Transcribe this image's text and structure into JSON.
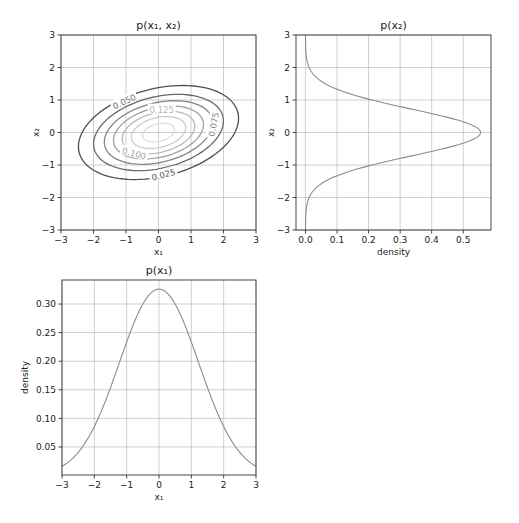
{
  "figure": {
    "width": 519,
    "height": 523,
    "background": "#ffffff"
  },
  "chart_data": [
    {
      "id": "joint",
      "type": "contour",
      "title": "p(x₁, x₂)",
      "xlabel": "x₁",
      "ylabel": "x₂",
      "xlim": [
        -3,
        3
      ],
      "ylim": [
        -3,
        3
      ],
      "xticks": [
        -3,
        -2,
        -1,
        0,
        1,
        2,
        3
      ],
      "yticks": [
        -3,
        -2,
        -1,
        0,
        1,
        2,
        3
      ],
      "xtick_labels": [
        "−3",
        "−2",
        "−1",
        "0",
        "1",
        "2",
        "3"
      ],
      "ytick_labels": [
        "−3",
        "−2",
        "−1",
        "0",
        "1",
        "2",
        "3"
      ],
      "grid": true,
      "distribution": {
        "mean": [
          0,
          0
        ],
        "sigma_x1": 1.224,
        "sigma_x2": 0.719,
        "rho": 0.3
      },
      "levels": [
        0.025,
        0.05,
        0.075,
        0.1,
        0.125,
        0.15,
        0.175
      ],
      "level_colors": [
        "#505050",
        "#6a6a6a",
        "#858585",
        "#a0a0a0",
        "#b8b8b8",
        "#cccccc",
        "#dddddd"
      ],
      "contour_labels": [
        {
          "text": "0.025",
          "x": 0.15,
          "y": -1.3,
          "angle": -15
        },
        {
          "text": "0.050",
          "x": -1.05,
          "y": 0.95,
          "angle": -25
        },
        {
          "text": "0.075",
          "x": 1.7,
          "y": 0.25,
          "angle": -80
        },
        {
          "text": "0.100",
          "x": -0.75,
          "y": -0.65,
          "angle": 15
        },
        {
          "text": "0.125",
          "x": 0.1,
          "y": 0.7,
          "angle": 0
        }
      ],
      "bbox": {
        "left": 61,
        "top": 35,
        "width": 195,
        "height": 195
      }
    },
    {
      "id": "marginal_x2",
      "type": "line",
      "orientation": "vertical",
      "title": "p(x₂)",
      "xlabel": "density",
      "ylabel": "x₂",
      "xlim": [
        -0.03,
        0.588
      ],
      "ylim": [
        -3,
        3
      ],
      "xticks": [
        0.0,
        0.1,
        0.2,
        0.3,
        0.4,
        0.5
      ],
      "xtick_labels": [
        "0.0",
        "0.1",
        "0.2",
        "0.3",
        "0.4",
        "0.5"
      ],
      "yticks": [
        -3,
        -2,
        -1,
        0,
        1,
        2,
        3
      ],
      "ytick_labels": [
        "−3",
        "−2",
        "−1",
        "0",
        "1",
        "2",
        "3"
      ],
      "grid": true,
      "line_color": "#8c8c8c",
      "series": [
        {
          "name": "p(x₂)",
          "distribution": "normal",
          "mean": 0,
          "std": 0.719,
          "peak": 0.555
        }
      ],
      "sample_points": [
        [
          -3,
          0.0
        ],
        [
          -2,
          0.012
        ],
        [
          -1.5,
          0.06
        ],
        [
          -1,
          0.21
        ],
        [
          -0.5,
          0.44
        ],
        [
          0,
          0.555
        ],
        [
          0.5,
          0.44
        ],
        [
          1,
          0.21
        ],
        [
          1.5,
          0.06
        ],
        [
          2,
          0.012
        ],
        [
          3,
          0.0
        ]
      ],
      "bbox": {
        "left": 296,
        "top": 35,
        "width": 195,
        "height": 195
      }
    },
    {
      "id": "marginal_x1",
      "type": "line",
      "title": "p(x₁)",
      "xlabel": "x₁",
      "ylabel": "density",
      "xlim": [
        -3,
        3
      ],
      "ylim": [
        0.001,
        0.342
      ],
      "xticks": [
        -3,
        -2,
        -1,
        0,
        1,
        2,
        3
      ],
      "xtick_labels": [
        "−3",
        "−2",
        "−1",
        "0",
        "1",
        "2",
        "3"
      ],
      "yticks": [
        0.05,
        0.1,
        0.15,
        0.2,
        0.25,
        0.3
      ],
      "ytick_labels": [
        "0.05",
        "0.10",
        "0.15",
        "0.20",
        "0.25",
        "0.30"
      ],
      "grid": true,
      "line_color": "#8c8c8c",
      "series": [
        {
          "name": "p(x₁)",
          "distribution": "normal",
          "mean": 0,
          "std": 1.224,
          "peak": 0.326
        }
      ],
      "sample_points": [
        [
          -3,
          0.016
        ],
        [
          -2,
          0.085
        ],
        [
          -1,
          0.234
        ],
        [
          0,
          0.326
        ],
        [
          1,
          0.234
        ],
        [
          2,
          0.085
        ],
        [
          3,
          0.016
        ]
      ],
      "bbox": {
        "left": 62,
        "top": 280,
        "width": 194,
        "height": 195
      }
    }
  ]
}
